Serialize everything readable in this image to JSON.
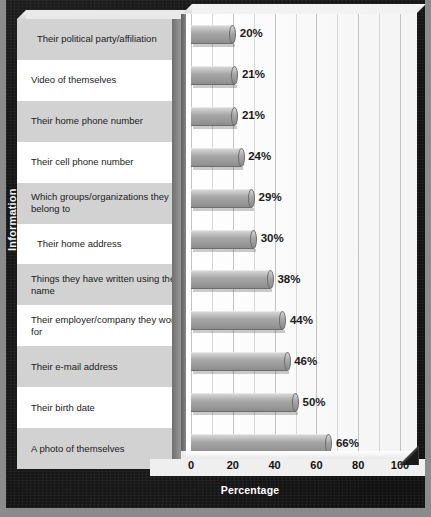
{
  "chart_data": {
    "type": "bar",
    "orientation": "horizontal",
    "title": "",
    "xlabel": "Percentage",
    "ylabel": "Information",
    "xlim": [
      0,
      100
    ],
    "xticks": [
      0,
      20,
      40,
      60,
      80,
      100
    ],
    "grid": true,
    "grid_step": 10,
    "legend": "none",
    "categories": [
      "Their political party/affiliation",
      "Video of themselves",
      "Their home phone number",
      "Their cell phone number",
      "Which groups/organizations they belong to",
      "Their home address",
      "Things they have written using their name",
      "Their employer/company they work for",
      "Their e-mail address",
      "Their birth date",
      "A photo of themselves"
    ],
    "values": [
      20,
      21,
      21,
      24,
      29,
      30,
      38,
      44,
      46,
      50,
      66
    ],
    "value_labels": [
      "20%",
      "21%",
      "21%",
      "24%",
      "29%",
      "30%",
      "38%",
      "44%",
      "46%",
      "50%",
      "66%"
    ]
  },
  "rows": [
    {
      "label": "Their political party/affiliation",
      "value": 20,
      "value_label": "20%",
      "indent": true
    },
    {
      "label": "Video of themselves",
      "value": 21,
      "value_label": "21%",
      "indent": false
    },
    {
      "label": "Their home phone number",
      "value": 21,
      "value_label": "21%",
      "indent": false
    },
    {
      "label": "Their cell phone number",
      "value": 24,
      "value_label": "24%",
      "indent": false
    },
    {
      "label": "Which groups/organizations they belong to",
      "value": 29,
      "value_label": "29%",
      "indent": false
    },
    {
      "label": "Their home address",
      "value": 30,
      "value_label": "30%",
      "indent": true
    },
    {
      "label": "Things they have written using their name",
      "value": 38,
      "value_label": "38%",
      "indent": false
    },
    {
      "label": "Their employer/company they work for",
      "value": 44,
      "value_label": "44%",
      "indent": false
    },
    {
      "label": "Their e-mail address",
      "value": 46,
      "value_label": "46%",
      "indent": false
    },
    {
      "label": "Their birth date",
      "value": 50,
      "value_label": "50%",
      "indent": false
    },
    {
      "label": "A photo of themselves",
      "value": 66,
      "value_label": "66%",
      "indent": false
    }
  ],
  "axes": {
    "x_title": "Percentage",
    "y_title": "Information",
    "x_ticks": [
      "0",
      "20",
      "40",
      "60",
      "80",
      "100"
    ]
  },
  "colors": {
    "background": "#111112",
    "outer_margin": "#8b8b8b",
    "panel_stripe": "#d2d2d2",
    "panel_base": "#ffffff",
    "bar_fill": "#a6a6a6",
    "plot_background": "#ffffff",
    "gridline": "#d7d7d7",
    "text": "#1b1b1b",
    "axis_text_on_dark": "#ffffff"
  }
}
